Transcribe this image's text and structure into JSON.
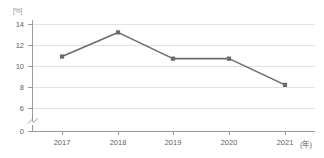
{
  "title_remnant": "··· ····· ·····   ··",
  "axis": {
    "y_unit": "[%]",
    "x_unit": "(年)",
    "y_ticks": [
      "14",
      "12",
      "10",
      "8",
      "6",
      "0"
    ],
    "x_ticks": [
      "2017",
      "2018",
      "2019",
      "2020",
      "2021"
    ],
    "break_marker": "axis-break"
  },
  "colors": {
    "line": "#6b6b6b",
    "marker": "#6b6b6b",
    "grid": "#e3e3e3",
    "axis": "#9a9a9a",
    "text": "#5f5f5f",
    "background": "#ffffff"
  },
  "chart_data": {
    "type": "line",
    "title": "",
    "xlabel": "(年)",
    "ylabel": "[%]",
    "categories": [
      "2017",
      "2018",
      "2019",
      "2020",
      "2021"
    ],
    "x": [
      2017,
      2018,
      2019,
      2020,
      2021
    ],
    "values": [
      10.9,
      13.2,
      10.7,
      10.7,
      8.2
    ],
    "series": [
      {
        "name": "series-1",
        "values": [
          10.9,
          13.2,
          10.7,
          10.7,
          8.2
        ],
        "color": "#6b6b6b",
        "marker": "square"
      }
    ],
    "ylim": [
      6,
      14
    ],
    "y_ticks": [
      6,
      8,
      10,
      12,
      14
    ],
    "y_axis_break_below": 6,
    "y_baseline_label": "0",
    "grid": true,
    "grid_axis": "y",
    "legend": false,
    "legend_position": "none"
  }
}
